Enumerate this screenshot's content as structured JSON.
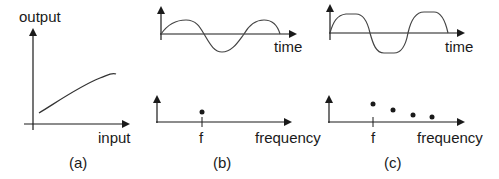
{
  "panels": [
    {
      "id": "a",
      "caption": "(a)",
      "y_label": "output",
      "x_label": "input",
      "description": "Concave increasing nonlinear input-output curve"
    },
    {
      "id": "b",
      "caption": "(b)",
      "time_label": "time",
      "freq_label": "frequency",
      "freq_tick": "f",
      "description": "Pure sine wave; single spectral component at f"
    },
    {
      "id": "c",
      "caption": "(c)",
      "time_label": "time",
      "freq_label": "frequency",
      "freq_tick": "f",
      "description": "Clipped/flattened sine wave; fundamental at f plus decaying harmonics"
    }
  ],
  "colors": {
    "ink": "#1a1a1a",
    "curve": "#333333"
  }
}
